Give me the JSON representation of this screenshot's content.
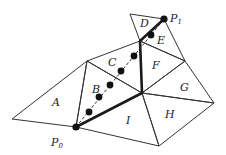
{
  "diagram": {
    "type": "triangulation-walk",
    "colors": {
      "edge": "#333333",
      "path": "#1a1a1a",
      "point": "#111111",
      "background": "#ffffff"
    },
    "vertices": {
      "a_left": [
        12,
        119
      ],
      "p0": [
        76,
        127
      ],
      "top": [
        87,
        61
      ],
      "center": [
        142,
        93
      ],
      "mid": [
        140,
        41
      ],
      "d_top": [
        130,
        14
      ],
      "p1": [
        164,
        19
      ],
      "right": [
        185,
        61
      ],
      "far_right": [
        214,
        103
      ],
      "bottom": [
        159,
        146
      ]
    },
    "triangles": [
      {
        "label": "A",
        "pos": [
          52,
          106
        ]
      },
      {
        "label": "B",
        "pos": [
          92,
          93
        ]
      },
      {
        "label": "C",
        "pos": [
          108,
          66
        ]
      },
      {
        "label": "D",
        "pos": [
          142,
          27
        ]
      },
      {
        "label": "E",
        "pos": [
          157,
          44
        ]
      },
      {
        "label": "F",
        "pos": [
          153,
          68
        ]
      },
      {
        "label": "G",
        "pos": [
          182,
          91
        ]
      },
      {
        "label": "H",
        "pos": [
          168,
          119
        ]
      },
      {
        "label": "I",
        "pos": [
          126,
          124
        ]
      }
    ],
    "points": {
      "p0_label": "P",
      "p0_sub": "0",
      "p1_label": "P",
      "p1_sub": "1"
    },
    "dots": [
      [
        76,
        127
      ],
      [
        89,
        112
      ],
      [
        99,
        97
      ],
      [
        110,
        85
      ],
      [
        121,
        71
      ],
      [
        134,
        56
      ],
      [
        152,
        34
      ],
      [
        164,
        19
      ]
    ]
  }
}
